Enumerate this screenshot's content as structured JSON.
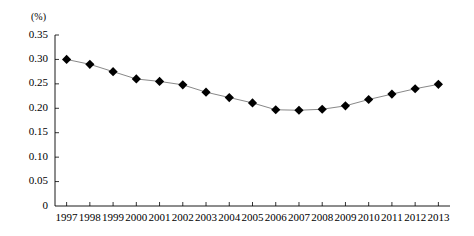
{
  "chart_data": {
    "type": "line",
    "title": "",
    "subtitle": "",
    "xlabel": "",
    "ylabel": "",
    "unit_label": "(%)",
    "grid": false,
    "legend": false,
    "marker": "diamond",
    "marker_color": "#000000",
    "line_color": "#7a7a7a",
    "categories": [
      "1997",
      "1998",
      "1999",
      "2000",
      "2001",
      "2002",
      "2003",
      "2004",
      "2005",
      "2006",
      "2007",
      "2008",
      "2009",
      "2010",
      "2011",
      "2012",
      "2013"
    ],
    "values": [
      0.3,
      0.29,
      0.275,
      0.26,
      0.255,
      0.248,
      0.233,
      0.222,
      0.211,
      0.197,
      0.196,
      0.198,
      0.205,
      0.218,
      0.229,
      0.24,
      0.249
    ],
    "ylim": [
      0,
      0.35
    ],
    "yticks": [
      0,
      0.05,
      0.1,
      0.15,
      0.2,
      0.25,
      0.3,
      0.35
    ],
    "ytick_labels": [
      "0",
      "0.05",
      "0.10",
      "0.15",
      "0.20",
      "0.25",
      "0.30",
      "0.35"
    ],
    "xtick_labels": [
      "1997",
      "1998",
      "1999",
      "2000",
      "2001",
      "2002",
      "2003",
      "2004",
      "2005",
      "2006",
      "2007",
      "2008",
      "2009",
      "2010",
      "2011",
      "2012",
      "2013"
    ]
  }
}
